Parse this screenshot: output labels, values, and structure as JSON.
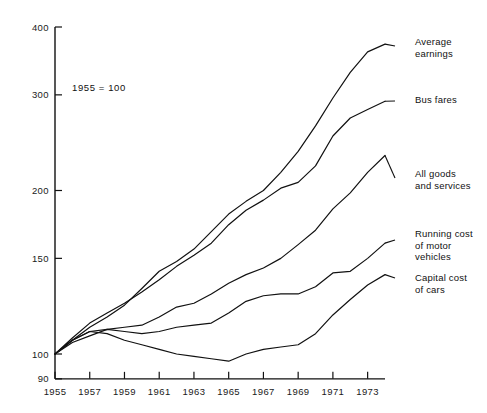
{
  "figure": {
    "base_note": "1955 = 100",
    "cropped_title": "",
    "axis_color": "#111111",
    "line_color": "#111111",
    "background": "#ffffff"
  },
  "chart_data": {
    "type": "line",
    "title": "",
    "subtitle": "",
    "xlabel": "",
    "ylabel": "",
    "annotation": "1955 = 100",
    "yscale": "log",
    "ylim": [
      90,
      400
    ],
    "xlim": [
      1955,
      1974
    ],
    "yticks": [
      90,
      100,
      150,
      200,
      300,
      400
    ],
    "ytick_labels": [
      "90",
      "100",
      "150",
      "200",
      "300",
      "400"
    ],
    "xticks": [
      1955,
      1957,
      1959,
      1961,
      1963,
      1965,
      1967,
      1969,
      1971,
      1973
    ],
    "xtick_labels": [
      "1955",
      "1957",
      "1959",
      "1961",
      "1963",
      "1965",
      "1967",
      "1969",
      "1971",
      "1973"
    ],
    "grid": false,
    "legend": "inline-right-labels",
    "x": [
      1955,
      1956,
      1957,
      1958,
      1959,
      1960,
      1961,
      1962,
      1963,
      1964,
      1965,
      1966,
      1967,
      1968,
      1969,
      1970,
      1971,
      1972,
      1973,
      1974
    ],
    "series": [
      {
        "name": "Average earnings",
        "label": "Average\nearnings",
        "label_line1": "Average",
        "label_line2": "earnings",
        "values": [
          100,
          106,
          112,
          117,
          123,
          132,
          142,
          148,
          156,
          168,
          181,
          191,
          200,
          216,
          236,
          263,
          296,
          330,
          360,
          372
        ]
      },
      {
        "name": "Bus fares",
        "label": "Bus fares",
        "label_line1": "Bus fares",
        "label_line2": "",
        "values": [
          100,
          107,
          114,
          119,
          124,
          130,
          137,
          145,
          152,
          160,
          173,
          184,
          192,
          202,
          207,
          222,
          252,
          272,
          282,
          292
        ]
      },
      {
        "name": "All goods and services",
        "label": "All goods\nand services",
        "label_line1": "All goods",
        "label_line2": "and services",
        "values": [
          100,
          105,
          108,
          111,
          112,
          113,
          117,
          122,
          124,
          129,
          135,
          140,
          144,
          150,
          159,
          169,
          185,
          198,
          216,
          232
        ]
      },
      {
        "name": "Running cost of motor vehicles",
        "label": "Running cost\nof motor\nvehicles",
        "label_line1": "Running cost",
        "label_line2": "of motor",
        "label_line3": "vehicles",
        "values": [
          100,
          106,
          110,
          111,
          110,
          109,
          110,
          112,
          113,
          114,
          119,
          125,
          128,
          129,
          129,
          133,
          141,
          142,
          150,
          160
        ]
      },
      {
        "name": "Capital cost of cars",
        "label": "Capital cost\nof cars",
        "label_line1": "Capital cost",
        "label_line2": "of cars",
        "values": [
          100,
          106,
          110,
          109,
          106,
          104,
          102,
          100,
          99,
          98,
          97,
          100,
          102,
          103,
          104,
          109,
          118,
          126,
          134,
          140
        ]
      }
    ]
  }
}
